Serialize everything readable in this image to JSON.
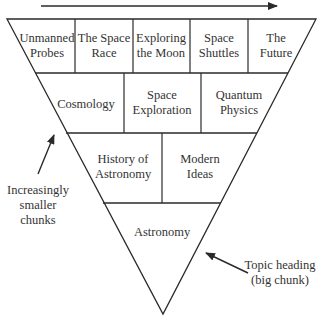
{
  "diagram": {
    "type": "inverted-triangle-hierarchy",
    "top_arrow": "direction-right",
    "rows": [
      {
        "level": 1,
        "cells": [
          {
            "line1": "Unmanned",
            "line2": "Probes"
          },
          {
            "line1": "The Space",
            "line2": "Race"
          },
          {
            "line1": "Exploring",
            "line2": "the Moon"
          },
          {
            "line1": "Space",
            "line2": "Shuttles"
          },
          {
            "line1": "The",
            "line2": "Future"
          }
        ]
      },
      {
        "level": 2,
        "cells": [
          {
            "line1": "Cosmology",
            "line2": ""
          },
          {
            "line1": "Space",
            "line2": "Exploration"
          },
          {
            "line1": "Quantum",
            "line2": "Physics"
          }
        ]
      },
      {
        "level": 3,
        "cells": [
          {
            "line1": "History of",
            "line2": "Astronomy"
          },
          {
            "line1": "Modern",
            "line2": "Ideas"
          }
        ]
      },
      {
        "level": 4,
        "cells": [
          {
            "line1": "Astronomy",
            "line2": ""
          }
        ]
      }
    ],
    "annotations": {
      "left": {
        "line1": "Increasingly",
        "line2": "smaller",
        "line3": "chunks"
      },
      "right": {
        "line1": "Topic heading",
        "line2": "(big chunk)"
      }
    },
    "colors": {
      "line": "#2a2a2a",
      "background": "#ffffff",
      "text": "#333333"
    }
  }
}
